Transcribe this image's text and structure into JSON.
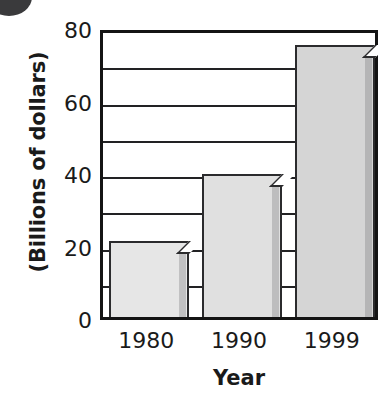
{
  "chart_data": {
    "type": "bar",
    "title": "",
    "subtitle": "",
    "xlabel": "Year",
    "ylabel": "(Billions of dollars)",
    "categories": [
      "1980",
      "1990",
      "1999"
    ],
    "values": [
      21,
      39.5,
      75
    ],
    "series": [
      {
        "name": "",
        "values": [
          21,
          39.5,
          75
        ]
      }
    ],
    "ylim": [
      0,
      80
    ],
    "ytick_labels": [
      "0",
      "20",
      "40",
      "60",
      "80"
    ],
    "ytick_values": [
      0,
      20,
      40,
      60,
      80
    ],
    "gridline_values": [
      10,
      20,
      30,
      40,
      50,
      60,
      70
    ],
    "grid": true,
    "grid_interval": 10,
    "legend": false,
    "legend_position": "none",
    "bar_colors": [
      "#e6e6e6",
      "#e0e0e0",
      "#d5d5d5"
    ],
    "bar_border_color": "#2b2b2d",
    "axis_color": "#141414",
    "text_color": "#1a1a1a",
    "background": "#ffffff",
    "annotations": []
  },
  "axes": {
    "y_title": "(Billions of dollars)",
    "x_title": "Year"
  },
  "decorations": {
    "corner_marker": "filled-circle"
  }
}
